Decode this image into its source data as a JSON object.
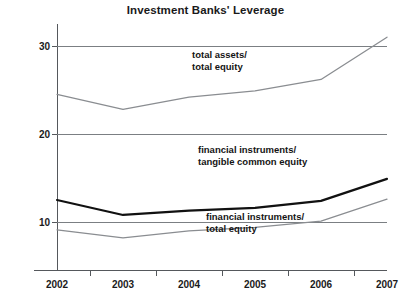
{
  "chart": {
    "title": "Investment Banks' Leverage"
  },
  "chart_data": {
    "type": "line",
    "title": "Investment Banks' Leverage",
    "xlabel": "",
    "ylabel": "",
    "x": [
      2002,
      2003,
      2004,
      2005,
      2006,
      2007
    ],
    "categories": [
      "2002",
      "2003",
      "2004",
      "2005",
      "2006",
      "2007"
    ],
    "xtick_labels": [
      "2002",
      "2003",
      "2004",
      "2005",
      "2006",
      "2007"
    ],
    "ytick_labels": [
      "10",
      "20",
      "30"
    ],
    "yticks": [
      10,
      20,
      30
    ],
    "ylim": [
      5,
      32.5
    ],
    "xlim": [
      2002,
      2007
    ],
    "grid": true,
    "grid_axis": "y",
    "legend": "inline-annotations",
    "series": [
      {
        "name": "total assets/ total equity",
        "label_line1": "total assets/",
        "label_line2": "total equity",
        "color": "#8a8d91",
        "width": 1.3,
        "values": [
          24.5,
          22.8,
          24.2,
          24.9,
          26.2,
          31.0
        ]
      },
      {
        "name": "financial instruments/ tangible common equity",
        "label_line1": "financial instruments/",
        "label_line2": "tangible common equity",
        "color": "#111111",
        "width": 2.2,
        "values": [
          12.5,
          10.8,
          11.3,
          11.6,
          12.4,
          14.9
        ]
      },
      {
        "name": "financial instruments/ total equity",
        "label_line1": "financial instruments/",
        "label_line2": "total equity",
        "color": "#8a8d91",
        "width": 1.3,
        "values": [
          9.1,
          8.2,
          9.0,
          9.4,
          10.1,
          12.6
        ]
      }
    ]
  }
}
